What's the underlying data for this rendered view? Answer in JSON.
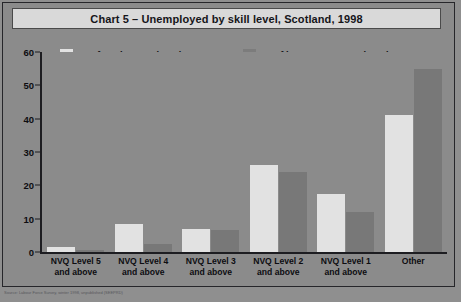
{
  "figure": {
    "title": "Chart 5 – Unemployed by skill level, Scotland, 1998",
    "footnote": "Source: Labour Force Survey, winter 1998, unpublished (SEEPRD)"
  },
  "legend": {
    "entries": [
      {
        "label": "% of total unemployed",
        "color": "#e2e2e2",
        "swatch": "total"
      },
      {
        "label": "% of long-term unemployed",
        "color": "#787878",
        "swatch": "longterm"
      }
    ]
  },
  "axes": {
    "y_ticks": [
      "0",
      "10",
      "20",
      "30",
      "40",
      "50",
      "60"
    ],
    "x_labels": [
      {
        "line1": "NVQ Level 5",
        "line2": "and above"
      },
      {
        "line1": "NVQ Level 4",
        "line2": "and above"
      },
      {
        "line1": "NVQ Level 3",
        "line2": "and above"
      },
      {
        "line1": "NVQ Level 2",
        "line2": "and above"
      },
      {
        "line1": "NVQ Level 1",
        "line2": "and above"
      },
      {
        "line1": "Other",
        "line2": ""
      }
    ]
  },
  "chart_data": {
    "type": "bar",
    "title": "Chart 5 – Unemployed by skill level, Scotland, 1998",
    "xlabel": "",
    "ylabel": "",
    "ylim": [
      0,
      60
    ],
    "yticks": [
      0,
      10,
      20,
      30,
      40,
      50,
      60
    ],
    "grid": false,
    "legend_position": "top",
    "categories": [
      "NVQ Level 5 and above",
      "NVQ Level 4 and above",
      "NVQ Level 3 and above",
      "NVQ Level 2 and above",
      "NVQ Level 1 and above",
      "Other"
    ],
    "series": [
      {
        "name": "% of total unemployed",
        "color": "#e2e2e2",
        "values": [
          1.5,
          8.5,
          7,
          26,
          17.5,
          41
        ]
      },
      {
        "name": "% of long-term unemployed",
        "color": "#787878",
        "values": [
          0.6,
          2.5,
          6.5,
          24,
          12,
          55
        ]
      }
    ]
  }
}
